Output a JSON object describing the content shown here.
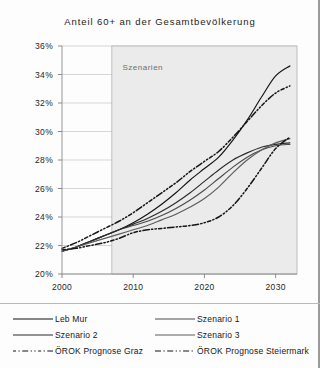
{
  "chart_data": {
    "type": "line",
    "title": "Anteil 60+ an der Gesamtbevölkerung",
    "xlabel": "",
    "ylabel": "",
    "xlim": [
      2000,
      2033
    ],
    "ylim": [
      20,
      36
    ],
    "ytick_labels": [
      "36%",
      "34%",
      "32%",
      "30%",
      "28%",
      "26%",
      "24%",
      "22%",
      "20%"
    ],
    "ytick_values": [
      36,
      34,
      32,
      30,
      28,
      26,
      24,
      22,
      20
    ],
    "xtick_labels": [
      "2000",
      "2010",
      "2020",
      "2030"
    ],
    "xtick_values": [
      2000,
      2010,
      2020,
      2030
    ],
    "grid": "horizontal",
    "legend_position": "below",
    "annotations": [
      {
        "text": "Szenarien",
        "x": 2008.5,
        "y": 34.3
      }
    ],
    "shaded_region": {
      "label": "Szenarien",
      "x_start": 2007,
      "x_end": 2033,
      "color": "#ebebeb"
    },
    "x": [
      2000,
      2002,
      2004,
      2006,
      2008,
      2010,
      2012,
      2014,
      2016,
      2018,
      2020,
      2022,
      2024,
      2026,
      2028,
      2030,
      2032
    ],
    "series": [
      {
        "name": "Leb Mur",
        "style": "solid",
        "color": "#111111",
        "values": [
          21.6,
          21.9,
          22.3,
          22.7,
          23.1,
          23.6,
          24.2,
          24.9,
          25.7,
          26.6,
          27.4,
          28.2,
          29.4,
          30.8,
          32.4,
          33.9,
          34.6
        ]
      },
      {
        "name": "Szenario 1",
        "style": "solid",
        "color": "#4a4a4a",
        "values": [
          21.6,
          21.9,
          22.3,
          22.7,
          23.1,
          23.4,
          23.7,
          24.1,
          24.6,
          25.2,
          25.9,
          26.7,
          27.5,
          28.2,
          28.7,
          29.0,
          29.1
        ]
      },
      {
        "name": "Szenario 2",
        "style": "solid",
        "color": "#2a2a2a",
        "values": [
          21.6,
          21.9,
          22.3,
          22.7,
          23.1,
          23.5,
          23.9,
          24.4,
          25.0,
          25.7,
          26.5,
          27.3,
          28.0,
          28.5,
          28.9,
          29.1,
          29.2
        ]
      },
      {
        "name": "Szenario 3",
        "style": "solid",
        "color": "#5c5c5c",
        "values": [
          21.6,
          21.9,
          22.2,
          22.5,
          22.8,
          23.1,
          23.4,
          23.8,
          24.2,
          24.7,
          25.3,
          26.1,
          27.1,
          28.0,
          28.7,
          29.2,
          29.5
        ]
      },
      {
        "name": "ÖROK Prognose Graz",
        "style": "dash-dot",
        "color": "#151515",
        "values": [
          21.7,
          21.8,
          22.0,
          22.2,
          22.5,
          22.9,
          23.1,
          23.2,
          23.3,
          23.4,
          23.6,
          24.0,
          24.8,
          26.0,
          27.4,
          28.8,
          29.6
        ]
      },
      {
        "name": "ÖROK Prognose Steiermark",
        "style": "dash-dot",
        "color": "#151515",
        "values": [
          21.8,
          22.2,
          22.7,
          23.2,
          23.7,
          24.3,
          25.0,
          25.7,
          26.4,
          27.2,
          27.9,
          28.6,
          29.6,
          30.7,
          31.8,
          32.7,
          33.2
        ]
      }
    ]
  },
  "legend": {
    "entries": [
      {
        "label": "Leb Mur",
        "style": "solid"
      },
      {
        "label": "Szenario 1",
        "style": "solid"
      },
      {
        "label": "Szenario 2",
        "style": "solid"
      },
      {
        "label": "Szenario 3",
        "style": "solid"
      },
      {
        "label": "ÖROK Prognose Graz",
        "style": "dash-dot"
      },
      {
        "label": "ÖROK Prognose Steiermark",
        "style": "dash-dot"
      }
    ]
  }
}
